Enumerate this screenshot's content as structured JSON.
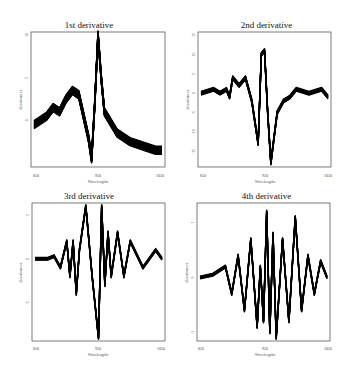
{
  "chart_data": [
    {
      "type": "line",
      "title": "1st derivative",
      "xlabel": "Wavelengths",
      "ylabel": "Absorbances",
      "xticks": [
        "850",
        "950",
        "1050"
      ],
      "yticks": [
        "0",
        "5",
        "10"
      ],
      "xlim": [
        850,
        1050
      ],
      "ylim": [
        -5,
        10
      ],
      "grid": false,
      "series_description": "Many overlaid spectra forming a dense band",
      "x": [
        850,
        870,
        880,
        890,
        900,
        910,
        920,
        935,
        940,
        945,
        950,
        955,
        960,
        980,
        1000,
        1020,
        1040,
        1050
      ],
      "values": [
        -0.5,
        0.5,
        1.5,
        1.0,
        2.5,
        3.5,
        3.0,
        -2.0,
        -4.5,
        2.0,
        10.0,
        5.0,
        1.0,
        -1.5,
        -2.5,
        -3.0,
        -3.5,
        -3.5
      ]
    },
    {
      "type": "line",
      "title": "2nd derivative",
      "xlabel": "Wavelengths",
      "ylabel": "Absorbances",
      "xticks": [
        "850",
        "950",
        "1050"
      ],
      "yticks": [
        "-15",
        "-10",
        "-5",
        "0",
        "5",
        "10",
        "15"
      ],
      "xlim": [
        850,
        1050
      ],
      "ylim": [
        -18,
        15
      ],
      "grid": false,
      "x": [
        850,
        870,
        880,
        890,
        895,
        900,
        910,
        920,
        930,
        940,
        945,
        950,
        955,
        960,
        970,
        980,
        990,
        1000,
        1020,
        1040,
        1050
      ],
      "values": [
        0,
        1,
        0,
        1,
        -1,
        4,
        2,
        4,
        -2,
        -13,
        10,
        11,
        -5,
        -18,
        -5,
        -2,
        -1,
        1,
        0,
        1,
        -1
      ]
    },
    {
      "type": "line",
      "title": "3rd derivative",
      "xlabel": "Wavelengths",
      "ylabel": "Absorbances",
      "xticks": [
        "850",
        "950",
        "1050"
      ],
      "yticks": [
        "-5",
        "0",
        "5"
      ],
      "xlim": [
        850,
        1050
      ],
      "ylim": [
        -9,
        6
      ],
      "grid": false,
      "x": [
        850,
        870,
        880,
        890,
        900,
        905,
        910,
        915,
        920,
        930,
        940,
        950,
        955,
        960,
        965,
        970,
        980,
        990,
        1000,
        1020,
        1040,
        1050
      ],
      "values": [
        0,
        0,
        0.3,
        -1,
        2,
        -2,
        2,
        -4,
        1,
        6,
        -2,
        -9,
        6,
        -3,
        3,
        -2,
        3,
        -2,
        2,
        -1,
        1,
        0
      ]
    },
    {
      "type": "line",
      "title": "4th derivative",
      "xlabel": "Wavelengths",
      "ylabel": "Absorbances",
      "xticks": [
        "850",
        "950",
        "1050"
      ],
      "yticks": [
        "-1",
        "0",
        "1"
      ],
      "xlim": [
        850,
        1050
      ],
      "ylim": [
        -1.1,
        1.3
      ],
      "grid": false,
      "x": [
        850,
        870,
        890,
        900,
        910,
        920,
        930,
        940,
        945,
        950,
        955,
        960,
        965,
        970,
        980,
        990,
        1000,
        1010,
        1020,
        1030,
        1040,
        1050
      ],
      "values": [
        0,
        0.05,
        0.2,
        -0.3,
        0.4,
        -0.6,
        0.7,
        -0.9,
        0.2,
        -0.8,
        1.2,
        -1.0,
        0.8,
        -1.1,
        0.7,
        -0.8,
        1.1,
        -0.6,
        0.4,
        -0.3,
        0.3,
        0
      ]
    }
  ]
}
